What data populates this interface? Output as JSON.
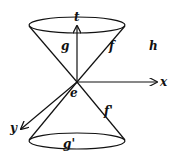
{
  "diagram": {
    "labels": {
      "t_axis": "t",
      "x_axis": "x",
      "y_axis": "y",
      "event": "e",
      "future_interior": "g",
      "future_surface": "f",
      "past_interior": "g'",
      "past_surface": "f'",
      "exterior": "h"
    },
    "colors": {
      "stroke": "#111111",
      "background": "#ffffff"
    }
  }
}
